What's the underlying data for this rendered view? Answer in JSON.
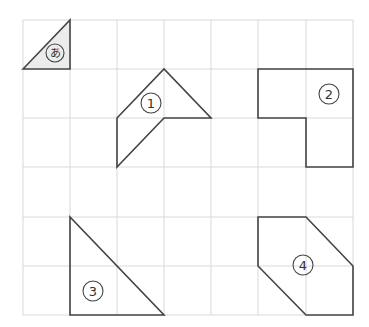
{
  "diagram": {
    "grid": {
      "columns": 7,
      "rows": 6,
      "x_lines": [
        23,
        70,
        117,
        164,
        211,
        258,
        306,
        353
      ],
      "y_lines": [
        20,
        69,
        118,
        167,
        217,
        266,
        315
      ],
      "line_color": "#d9d9d9"
    },
    "shapes": [
      {
        "id": "a",
        "label": "あ",
        "type": "triangle",
        "filled": true,
        "fill": "#ececec",
        "points": "23,69 70,20 70,69",
        "label_pos": [
          55,
          53
        ],
        "label_size": 11
      },
      {
        "id": "1",
        "label": "1",
        "type": "pentagon",
        "filled": false,
        "points": "117,118 164,69 211,118 164,118 117,167",
        "label_pos": [
          151,
          103
        ],
        "label_size": 13
      },
      {
        "id": "2",
        "label": "2",
        "type": "l-shape",
        "filled": false,
        "points": "258,69 353,69 353,167 306,167 306,118 258,118",
        "label_pos": [
          329,
          94
        ],
        "label_size": 13
      },
      {
        "id": "3",
        "label": "3",
        "type": "right-triangle",
        "filled": false,
        "points": "70,217 70,315 164,315",
        "label_pos": [
          93,
          291
        ],
        "label_size": 13
      },
      {
        "id": "4",
        "label": "4",
        "type": "hexagon",
        "filled": false,
        "points": "258,217 306,217 353,266 353,315 306,315 258,266",
        "label_pos": [
          303,
          265
        ],
        "label_size": 13
      }
    ],
    "labels": {
      "a": "あ",
      "one": "1",
      "two": "2",
      "three": "3",
      "four": "4"
    }
  }
}
